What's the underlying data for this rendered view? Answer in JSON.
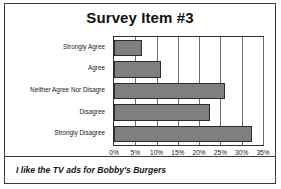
{
  "chart_data": {
    "type": "bar",
    "orientation": "horizontal",
    "title": "Survey Item #3",
    "caption": "I like the TV ads for Bobby's Burgers",
    "categories": [
      "Strongly Agree",
      "Agree",
      "Neither Agree Nor Disagre",
      "Disagree",
      "Strongly Disagree"
    ],
    "values": [
      6.5,
      11,
      26,
      22.5,
      32.5
    ],
    "xlabel": "",
    "ylabel": "",
    "xlim": [
      0,
      35
    ],
    "xticks": [
      0,
      5,
      10,
      15,
      20,
      25,
      30,
      35
    ],
    "xticklabels": [
      "0%",
      "5%",
      "10%",
      "15%",
      "20%",
      "25%",
      "30%",
      "35%"
    ],
    "grid": "vertical",
    "legend": "none",
    "bar_color": "#7f7f7f",
    "bar_border_color": "#2b2b2b",
    "gridline_color": "#6d6d6d",
    "axis_color": "#2e2e2e",
    "frame_color": "#3b3b3b",
    "background": "#ffffff"
  }
}
